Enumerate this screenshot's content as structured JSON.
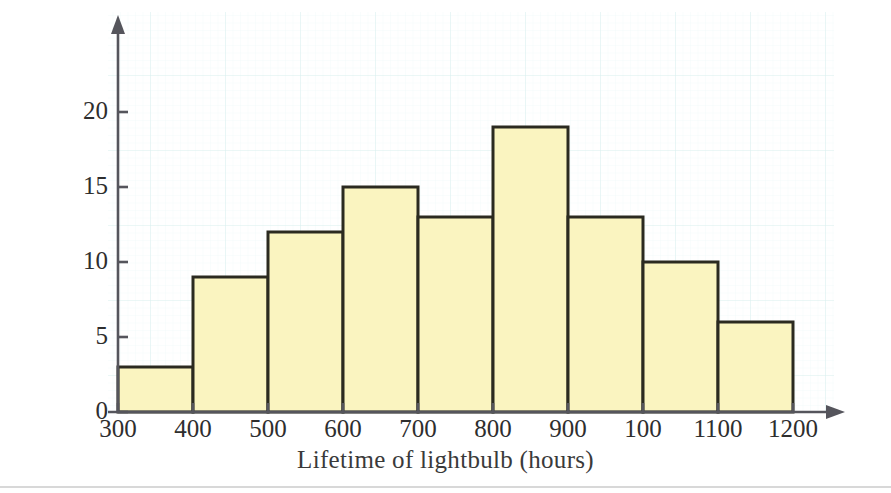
{
  "figure": {
    "background_color": "#ffffff",
    "grid_color": "#dff0ef",
    "bar_fill_color": "#faf4c0",
    "bar_edge_color": "#2b2a20",
    "axis_color": "#55555c",
    "text_color": "#2e2e2e"
  },
  "chart_data": {
    "type": "bar",
    "title": "",
    "subtitle": "",
    "xlabel": "Lifetime of lightbulb (hours)",
    "ylabel": "Frequency",
    "categories": [
      "300-400",
      "400-500",
      "500-600",
      "600-700",
      "700-800",
      "800-900",
      "900-1000",
      "1000-1100",
      "1100-1200"
    ],
    "bin_edges": [
      300,
      400,
      500,
      600,
      700,
      800,
      900,
      1000,
      1100,
      1200
    ],
    "values": [
      3,
      9,
      12,
      15,
      13,
      19,
      13,
      10,
      6
    ],
    "xtick_labels": [
      "300",
      "400",
      "500",
      "600",
      "700",
      "800",
      "900",
      "100",
      "1100",
      "1200"
    ],
    "ytick_labels": [
      "0",
      "5",
      "10",
      "15",
      "20"
    ],
    "ytick_values": [
      0,
      5,
      10,
      15,
      20
    ],
    "xlim": [
      300,
      1200
    ],
    "ylim": [
      0,
      24
    ],
    "grid": true,
    "legend": "none",
    "bin_width": 100,
    "total_frequency": 100
  }
}
